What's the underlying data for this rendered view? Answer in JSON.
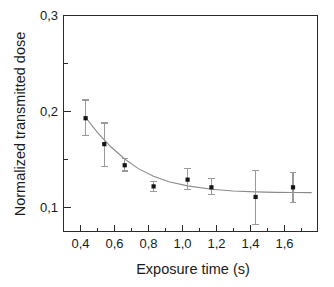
{
  "figure": {
    "background_color": "#ffffff",
    "frame_color": "#2b2b2b",
    "marker_color": "#141414",
    "errorbar_color": "#9a9a9a",
    "curve_color": "#8a8a8a"
  },
  "chart_data": {
    "type": "scatter",
    "title": "",
    "xlabel": "Exposure time (s)",
    "ylabel": "Normalized transmitted dose",
    "xlim": [
      0.3,
      1.8
    ],
    "ylim": [
      0.06,
      0.3
    ],
    "grid": false,
    "legend": null,
    "x_tick_labels": [
      "0,4",
      "0,6",
      "0,8",
      "1,0",
      "1,2",
      "1,4",
      "1,6"
    ],
    "x_ticks": [
      0.4,
      0.6,
      0.8,
      1.0,
      1.2,
      1.4,
      1.6
    ],
    "x_minor_ticks": [
      0.5,
      0.7,
      0.9,
      1.1,
      1.3,
      1.5,
      1.7
    ],
    "y_tick_labels": [
      "0,1",
      "0,2",
      "0,3"
    ],
    "y_ticks": [
      0.1,
      0.2,
      0.3
    ],
    "y_minor_ticks": [
      0.15,
      0.25
    ],
    "decimal_separator": ",",
    "series": [
      {
        "name": "Normalized transmitted dose",
        "marker": "filled-square",
        "points": [
          {
            "x": 0.43,
            "y": 0.193,
            "yerr_low": 0.175,
            "yerr_high": 0.212
          },
          {
            "x": 0.54,
            "y": 0.166,
            "yerr_low": 0.143,
            "yerr_high": 0.188
          },
          {
            "x": 0.66,
            "y": 0.144,
            "yerr_low": 0.138,
            "yerr_high": 0.151
          },
          {
            "x": 0.83,
            "y": 0.122,
            "yerr_low": 0.117,
            "yerr_high": 0.127
          },
          {
            "x": 1.03,
            "y": 0.129,
            "yerr_low": 0.119,
            "yerr_high": 0.141
          },
          {
            "x": 1.17,
            "y": 0.121,
            "yerr_low": 0.114,
            "yerr_high": 0.13
          },
          {
            "x": 1.43,
            "y": 0.111,
            "yerr_low": 0.082,
            "yerr_high": 0.139
          },
          {
            "x": 1.65,
            "y": 0.121,
            "yerr_low": 0.105,
            "yerr_high": 0.136
          }
        ]
      }
    ],
    "fit_curve": {
      "description": "exponential decay fit",
      "points": [
        {
          "x": 0.43,
          "y": 0.194
        },
        {
          "x": 0.5,
          "y": 0.178
        },
        {
          "x": 0.58,
          "y": 0.163
        },
        {
          "x": 0.66,
          "y": 0.1505
        },
        {
          "x": 0.74,
          "y": 0.1405
        },
        {
          "x": 0.83,
          "y": 0.1325
        },
        {
          "x": 0.92,
          "y": 0.1268
        },
        {
          "x": 1.03,
          "y": 0.1225
        },
        {
          "x": 1.17,
          "y": 0.119
        },
        {
          "x": 1.3,
          "y": 0.1172
        },
        {
          "x": 1.43,
          "y": 0.1163
        },
        {
          "x": 1.55,
          "y": 0.1158
        },
        {
          "x": 1.65,
          "y": 0.1156
        },
        {
          "x": 1.76,
          "y": 0.1155
        }
      ]
    }
  }
}
